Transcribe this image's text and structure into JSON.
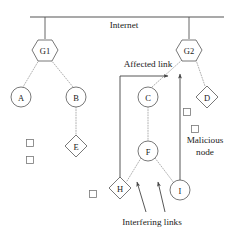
{
  "figure": {
    "backbone_label": "Internet"
  },
  "labels": {
    "internet": "Internet",
    "affected_link": "Affected link",
    "malicious_node": "Malicious\nnode",
    "malicious_node_line1": "Malicious",
    "malicious_node_line2": "node",
    "interfering_links": "Interfering links"
  },
  "nodes": [
    {
      "id": "G1",
      "label": "G1",
      "shape": "hexagon",
      "x": 45,
      "y": 50,
      "r": 11
    },
    {
      "id": "G2",
      "label": "G2",
      "shape": "hexagon",
      "x": 189,
      "y": 50,
      "r": 11
    },
    {
      "id": "A",
      "label": "A",
      "shape": "circle",
      "x": 21,
      "y": 97,
      "r": 10
    },
    {
      "id": "B",
      "label": "B",
      "shape": "circle",
      "x": 76,
      "y": 97,
      "r": 10
    },
    {
      "id": "C",
      "label": "C",
      "shape": "circle",
      "x": 148,
      "y": 97,
      "r": 10
    },
    {
      "id": "D",
      "label": "D",
      "shape": "diamond",
      "x": 207,
      "y": 97,
      "r": 11
    },
    {
      "id": "E",
      "label": "E",
      "shape": "diamond",
      "x": 76,
      "y": 146,
      "r": 11
    },
    {
      "id": "F",
      "label": "F",
      "shape": "circle",
      "x": 148,
      "y": 151,
      "r": 10
    },
    {
      "id": "H",
      "label": "H",
      "shape": "diamond",
      "x": 120,
      "y": 188,
      "r": 11
    },
    {
      "id": "I",
      "label": "I",
      "shape": "circle",
      "x": 180,
      "y": 190,
      "r": 10
    }
  ],
  "small_squares": [
    {
      "x": 30,
      "y": 143,
      "size": 7
    },
    {
      "x": 30,
      "y": 160,
      "size": 7
    },
    {
      "x": 187,
      "y": 112,
      "size": 7
    },
    {
      "x": 195,
      "y": 129,
      "size": 7
    },
    {
      "x": 93,
      "y": 194,
      "size": 7
    }
  ],
  "links": [
    {
      "from": "backbone",
      "to": "G1",
      "style": "solid"
    },
    {
      "from": "backbone",
      "to": "G2",
      "style": "solid"
    },
    {
      "from": "G1",
      "to": "A",
      "style": "dotted"
    },
    {
      "from": "G1",
      "to": "B",
      "style": "dotted"
    },
    {
      "from": "B",
      "to": "E",
      "style": "dotted"
    },
    {
      "from": "G2",
      "to": "C",
      "style": "dotted"
    },
    {
      "from": "G2",
      "to": "D",
      "style": "dotted"
    },
    {
      "from": "C",
      "to": "F",
      "style": "dotted"
    },
    {
      "from": "F",
      "to": "H",
      "style": "dotted"
    },
    {
      "from": "F",
      "to": "I",
      "style": "dotted"
    }
  ],
  "annotations": {
    "affected_link_arrow": {
      "label": "Affected link",
      "points_to": "G2-C link"
    },
    "interfering_arrows": {
      "count": 2,
      "label": "Interfering links"
    },
    "malicious_node_target": "D"
  },
  "colors": {
    "stroke": "#555555",
    "dotted": "#a8a8a8",
    "text": "#1a1a1a",
    "background": "#ffffff"
  }
}
